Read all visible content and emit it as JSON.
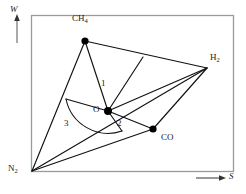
{
  "figure": {
    "kind": "ternary-style phase/region diagram",
    "frame": {
      "x": 31,
      "y": 15,
      "width": 203,
      "height": 157,
      "border_color": "#9a9a9a"
    },
    "line_color": "#111111",
    "vertex_dot_color": "#000000",
    "axes": [
      {
        "name": "w-axis",
        "label": "W",
        "arrow": "up",
        "x": 14,
        "y": 6
      },
      {
        "name": "s-axis",
        "label": "S",
        "arrow": "right",
        "x": 228,
        "y": 174
      }
    ],
    "vertices": [
      {
        "name": "CH4",
        "label": "CH",
        "sub": "4",
        "dot": true,
        "px": 85,
        "py": 41,
        "label_x": 73,
        "label_y": 15
      },
      {
        "name": "H2",
        "label": "H",
        "sub": "2",
        "dot": false,
        "px": 207,
        "py": 68,
        "label_x": 210,
        "label_y": 54
      },
      {
        "name": "CO",
        "label": "CO",
        "sub": "",
        "dot": true,
        "px": 153,
        "py": 129,
        "label_x": 161,
        "label_y": 134
      },
      {
        "name": "N2",
        "label": "N",
        "sub": "2",
        "dot": false,
        "px": 32,
        "py": 171,
        "label_x": 10,
        "label_y": 164
      },
      {
        "name": "O",
        "label": "O",
        "sub": "",
        "dot": true,
        "px": 108,
        "py": 111,
        "label_x": 93,
        "label_y": 105
      }
    ],
    "region_labels": [
      {
        "name": "region-1",
        "text": "1",
        "x": 102,
        "y": 83
      },
      {
        "name": "region-2",
        "text": "2",
        "x": 118,
        "y": 121
      },
      {
        "name": "region-3",
        "text": "3",
        "x": 65,
        "y": 121
      }
    ],
    "edges": [
      {
        "name": "edge-ch4-h2",
        "from": "CH4",
        "to": "H2"
      },
      {
        "name": "edge-ch4-n2",
        "from": "CH4",
        "to": "N2"
      },
      {
        "name": "edge-ch4-o",
        "from": "CH4",
        "to": "O"
      },
      {
        "name": "edge-n2-h2",
        "from": "N2",
        "to": "H2"
      },
      {
        "name": "edge-n2-co",
        "from": "N2",
        "to": "CO"
      },
      {
        "name": "edge-co-h2",
        "from": "CO",
        "to": "H2"
      },
      {
        "name": "edge-o-h2",
        "from": "O",
        "to": "H2"
      },
      {
        "name": "edge-o-co",
        "from": "O",
        "to": "CO"
      }
    ],
    "extra_segments": [
      {
        "name": "segment-ch4h2-to-o",
        "x1": 143,
        "y1": 57,
        "x2": 108,
        "y2": 111
      },
      {
        "name": "segment-sector-top",
        "x1": 71,
        "y1": 99,
        "x2": 108,
        "y2": 111
      },
      {
        "name": "segment-sector-bottom",
        "x1": 108,
        "y1": 111,
        "x2": 119,
        "y2": 130
      }
    ],
    "sector_arc": {
      "name": "sector-arc",
      "center_x": 108,
      "center_y": 111,
      "radius": 38,
      "start_x": 71,
      "start_y": 99,
      "end_x": 119,
      "end_y": 130,
      "sweep": "counterclockwise"
    }
  }
}
